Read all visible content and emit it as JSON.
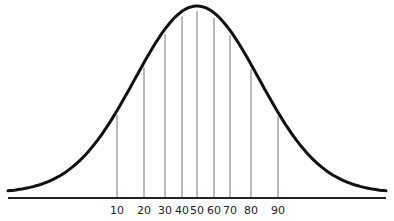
{
  "chart_data": {
    "type": "line",
    "title": "",
    "xlabel": "",
    "ylabel": "",
    "grid": false,
    "legend": null,
    "percentile_lines": [
      {
        "label": "10",
        "x": 117,
        "y_top": 118
      },
      {
        "label": "20",
        "x": 144,
        "y_top": 74
      },
      {
        "label": "30",
        "x": 165,
        "y_top": 45
      },
      {
        "label": "40",
        "x": 182,
        "y_top": 24
      },
      {
        "label": "50",
        "x": 197,
        "y_top": 10
      },
      {
        "label": "60",
        "x": 214,
        "y_top": 16
      },
      {
        "label": "70",
        "x": 230,
        "y_top": 33
      },
      {
        "label": "80",
        "x": 251,
        "y_top": 68
      },
      {
        "label": "90",
        "x": 278,
        "y_top": 120
      }
    ],
    "tick_labels": [
      "10",
      "20",
      "30",
      "40",
      "50",
      "60",
      "70",
      "80",
      "90"
    ],
    "curve": {
      "baseline_y": 198,
      "peak": {
        "x": 197,
        "y": 10
      },
      "left_x": 8,
      "right_x": 386
    }
  },
  "colors": {
    "curve": "#111111",
    "lines": "#777777",
    "baseline": "#222222",
    "background": "#ffffff"
  }
}
